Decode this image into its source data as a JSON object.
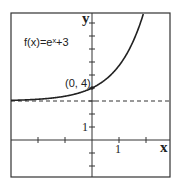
{
  "chart_data": {
    "type": "line",
    "title": "",
    "function_label": "f(x)=eˣ+3",
    "point_label": "(0, 4)",
    "point": [
      0,
      4
    ],
    "asymptote": {
      "y": 3,
      "style": "dashed"
    },
    "xlabel": "x",
    "ylabel": "y",
    "x_tick_label": "1",
    "y_tick_label": "1",
    "xlim": [
      -3,
      3
    ],
    "ylim": [
      -3,
      10
    ],
    "x_ticks": [
      -2,
      -1,
      1,
      2
    ],
    "y_ticks": [
      -2,
      -1,
      1,
      2,
      3,
      4,
      5,
      6,
      7,
      8,
      9
    ],
    "grid": false,
    "series": [
      {
        "name": "f(x)=e^x+3",
        "x": [
          -3,
          -2,
          -1,
          0,
          1,
          1.5,
          1.92
        ],
        "values": [
          3.05,
          3.14,
          3.37,
          4,
          5.72,
          7.48,
          9.82
        ]
      }
    ]
  }
}
